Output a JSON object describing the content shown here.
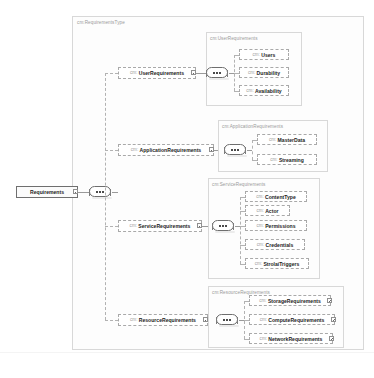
{
  "diagram": {
    "kind": "xml-schema-diagram",
    "root_type_frame_label": "cm:RequirementsType",
    "root_element": {
      "name": "Requirements",
      "namespace": "",
      "compositor": "sequence"
    },
    "branches": [
      {
        "id": "user",
        "element": {
          "namespace": "cm:",
          "name": "UserRequirements",
          "toggle": "collapse"
        },
        "frame_label": "cm:UserRequirements",
        "compositor": "sequence",
        "children": [
          {
            "namespace": "cm:",
            "name": "Users",
            "optional": true,
            "toggle": "none"
          },
          {
            "namespace": "cm:",
            "name": "Durability",
            "optional": true,
            "toggle": "none"
          },
          {
            "namespace": "cm:",
            "name": "Availability",
            "optional": true,
            "toggle": "none"
          }
        ]
      },
      {
        "id": "application",
        "element": {
          "namespace": "cm:",
          "name": "ApplicationRequirements",
          "toggle": "collapse"
        },
        "frame_label": "cm:ApplicationRequirements",
        "compositor": "sequence",
        "children": [
          {
            "namespace": "cm:",
            "name": "MasterData",
            "optional": true,
            "toggle": "none"
          },
          {
            "namespace": "cm:",
            "name": "Streaming",
            "optional": true,
            "toggle": "none"
          }
        ]
      },
      {
        "id": "service",
        "element": {
          "namespace": "cm:",
          "name": "ServiceRequirements",
          "toggle": "collapse"
        },
        "frame_label": "cm:ServiceRequirements",
        "compositor": "sequence",
        "children": [
          {
            "namespace": "cm:",
            "name": "ContentType",
            "optional": true,
            "toggle": "none"
          },
          {
            "namespace": "cm:",
            "name": "Actor",
            "optional": true,
            "toggle": "none"
          },
          {
            "namespace": "cm:",
            "name": "Permissions",
            "optional": true,
            "toggle": "none"
          },
          {
            "namespace": "cm:",
            "name": "Credentials",
            "optional": true,
            "toggle": "none"
          },
          {
            "namespace": "cm:",
            "name": "StrolaiTriggers",
            "optional": true,
            "toggle": "none"
          }
        ]
      },
      {
        "id": "resource",
        "element": {
          "namespace": "cm:",
          "name": "ResourceRequirements",
          "toggle": "collapse"
        },
        "frame_label": "cm:ResourceRequirements",
        "compositor": "sequence",
        "children": [
          {
            "namespace": "cm:",
            "name": "StorageRequirements",
            "optional": true,
            "toggle": "expand"
          },
          {
            "namespace": "cm:",
            "name": "ComputeRequirements",
            "optional": true,
            "toggle": "expand"
          },
          {
            "namespace": "cm:",
            "name": "NetworkRequirements",
            "optional": true,
            "toggle": "expand"
          }
        ]
      }
    ],
    "colors": {
      "background": "#ffffff",
      "frame_border": "#d8d8d8",
      "frame_fill": "#fdfdfd",
      "node_border": "#8e8e8e",
      "node_fill": "#ffffff",
      "connector": "#9a9a9a",
      "namespace_text": "#9d9d9d",
      "name_text": "#1b1b1b",
      "label_text": "#9a9a9a"
    }
  }
}
